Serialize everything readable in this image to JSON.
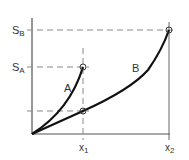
{
  "diagram": {
    "type": "stress-strain comparison",
    "curves": [
      {
        "label": "A",
        "end_x": "x1",
        "end_y": "S_A"
      },
      {
        "label": "B",
        "end_x": "x2",
        "end_y": "S_B"
      }
    ],
    "y_labels": {
      "sb_main": "S",
      "sb_sub": "B",
      "sa_main": "S",
      "sa_sub": "A"
    },
    "x_labels": {
      "x1_main": "x",
      "x1_sub": "1",
      "x2_main": "x",
      "x2_sub": "2"
    },
    "curve_labels": {
      "a": "A",
      "b": "B"
    },
    "colors": {
      "axis": "#555555",
      "curve": "#111111",
      "dashed": "#888888",
      "text": "#333333"
    }
  }
}
